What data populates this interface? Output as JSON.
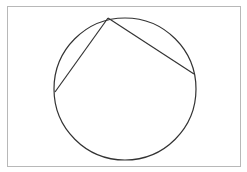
{
  "diagram": {
    "type": "circle-with-inscribed-chords",
    "frame": {
      "x": 7.5,
      "y": 6.5,
      "width": 233,
      "height": 160,
      "stroke": "#b8b8b8"
    },
    "circle": {
      "cx": 125,
      "cy": 89,
      "r": 71,
      "stroke": "#333333"
    },
    "points": {
      "top": {
        "x": 108,
        "y": 18
      },
      "left": {
        "x": 55,
        "y": 92
      },
      "right": {
        "x": 194,
        "y": 74
      }
    },
    "chords": [
      {
        "from": "top",
        "to": "left"
      },
      {
        "from": "top",
        "to": "right"
      }
    ],
    "line_color": "#333333"
  }
}
